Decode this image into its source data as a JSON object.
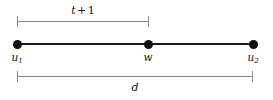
{
  "figure": {
    "type": "number-line-interval-diagram",
    "background_color": "#ffffff",
    "segment_color": "#1a1a1a",
    "bracket_color": "#8a8a8a",
    "label_color": "#111111"
  },
  "nodes": [
    {
      "id": "u1",
      "label_base": "u",
      "label_sub": "1",
      "x": 17
    },
    {
      "id": "w",
      "label_base": "w",
      "label_sub": "",
      "x": 148
    },
    {
      "id": "u2",
      "label_base": "u",
      "label_sub": "2",
      "x": 253
    }
  ],
  "measurements": {
    "top": {
      "name": "t-plus-1",
      "label_var": "t",
      "label_op": "+",
      "label_num": "1",
      "from_node": "u1",
      "to_node": "w",
      "span_px": 131
    },
    "bottom": {
      "name": "d",
      "label_var": "d",
      "from_node": "u1",
      "to_node": "u2",
      "span_px": 236
    }
  }
}
